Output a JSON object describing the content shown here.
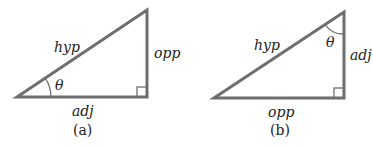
{
  "diagrams": [
    {
      "id": "a",
      "caption": "(a)",
      "labels": {
        "hyp": "hyp",
        "opp": "opp",
        "adj": "adj",
        "angle": "θ"
      },
      "vertices": {
        "left": [
          17,
          97
        ],
        "right": [
          147,
          97
        ],
        "top": [
          147,
          10
        ]
      }
    },
    {
      "id": "b",
      "caption": "(b)",
      "labels": {
        "hyp": "hyp",
        "opp": "opp",
        "adj": "adj",
        "angle": "θ"
      },
      "vertices": {
        "left": [
          214,
          98
        ],
        "right": [
          344,
          98
        ],
        "top": [
          344,
          12
        ]
      }
    }
  ],
  "colors": {
    "line": "#6e6e6e",
    "text": "#222222",
    "background": "#ffffff"
  }
}
